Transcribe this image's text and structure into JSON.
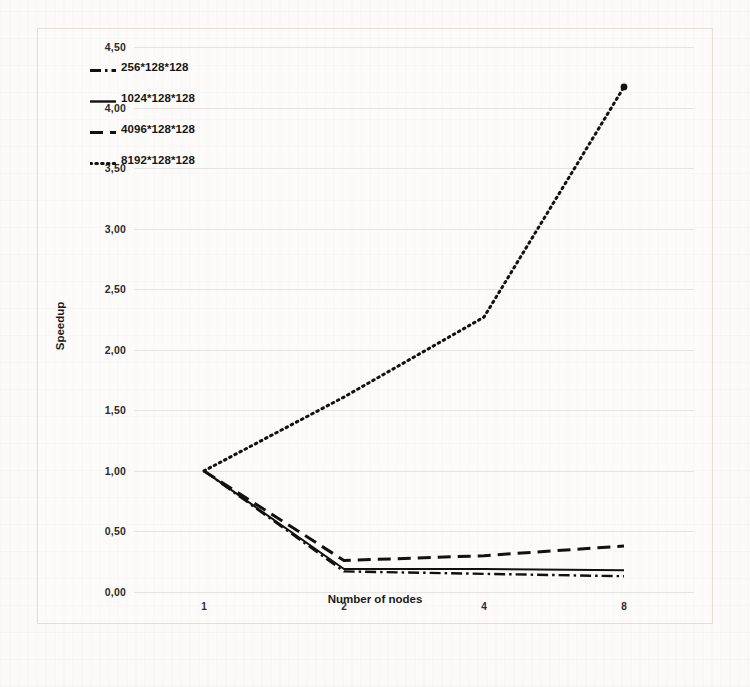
{
  "chart_data": {
    "type": "line",
    "title": "",
    "xlabel": "Number of nodes",
    "ylabel": "Speedup",
    "categories": [
      "1",
      "2",
      "4",
      "8"
    ],
    "x_tick_labels": [
      "1",
      "2",
      "4",
      "8"
    ],
    "y_tick_labels": [
      "0,00",
      "0,50",
      "1,00",
      "1,50",
      "2,00",
      "2,50",
      "3,00",
      "3,50",
      "4,00",
      "4,50"
    ],
    "y_tick_values": [
      0.0,
      0.5,
      1.0,
      1.5,
      2.0,
      2.5,
      3.0,
      3.5,
      4.0,
      4.5
    ],
    "ylim": [
      0.0,
      4.5
    ],
    "grid": true,
    "legend_position": "top-left",
    "decimal_separator": ",",
    "series": [
      {
        "name": "256*128*128",
        "line_style": "dash-dot",
        "values": [
          1.0,
          0.17,
          0.15,
          0.13
        ]
      },
      {
        "name": "1024*128*128",
        "line_style": "solid",
        "values": [
          1.0,
          0.19,
          0.19,
          0.18
        ]
      },
      {
        "name": "4096*128*128",
        "line_style": "long-dash",
        "values": [
          1.0,
          0.26,
          0.3,
          0.38
        ]
      },
      {
        "name": "8192*128*128",
        "line_style": "dotted",
        "values": [
          1.0,
          1.61,
          2.27,
          4.17
        ]
      }
    ]
  },
  "legend": {
    "items": [
      {
        "label": "256*128*128",
        "style": "dash-dot"
      },
      {
        "label": "1024*128*128",
        "style": "solid"
      },
      {
        "label": "4096*128*128",
        "style": "long-dash"
      },
      {
        "label": "8192*128*128",
        "style": "dotted"
      }
    ]
  },
  "axes": {
    "y_title": "Speedup",
    "x_title": "Number of nodes"
  },
  "colors": {
    "series_line": "#111111",
    "gridline": "#e6e4e0",
    "text": "#1a1a1a",
    "page_background": "#fbfaf8",
    "figure_border": "#e2dfd9"
  }
}
